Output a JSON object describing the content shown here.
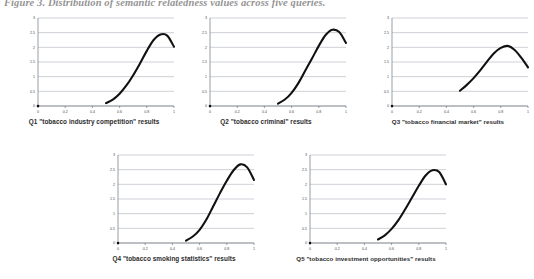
{
  "figure": {
    "title": "Figure 3. Distribution of semantic relatedness values across five queries.",
    "layout": "3 charts in top row, 2 charts in bottom row"
  },
  "charts": [
    {
      "id": "q1",
      "caption": "Q1 \"tobacco industry competition\" results",
      "chart_data": {
        "type": "line",
        "title": "Q1 \"tobacco industry competition\" results",
        "xlabel": "",
        "ylabel": "",
        "xlim": [
          0,
          1
        ],
        "ylim": [
          0,
          3
        ],
        "xticks": [
          "0",
          "0.2",
          "0.4",
          "0.6",
          "0.8",
          "1"
        ],
        "yticks": [
          "0",
          "0.5",
          "1",
          "1.5",
          "2",
          "2.5",
          "3"
        ],
        "grid": true,
        "legend": "none",
        "x": [
          0.0,
          0.5,
          0.55,
          0.6,
          0.65,
          0.7,
          0.75,
          0.8,
          0.85,
          0.9,
          0.95,
          1.0
        ],
        "y": [
          0.0,
          0.1,
          0.22,
          0.42,
          0.7,
          1.05,
          1.45,
          1.88,
          2.25,
          2.44,
          2.4,
          2.02
        ]
      }
    },
    {
      "id": "q2",
      "caption": "Q2 \"tobacco criminal\" results",
      "chart_data": {
        "type": "line",
        "title": "Q2 \"tobacco criminal\" results",
        "xlabel": "",
        "ylabel": "",
        "xlim": [
          0,
          1
        ],
        "ylim": [
          0,
          3
        ],
        "xticks": [
          "0",
          "0.2",
          "0.4",
          "0.6",
          "0.8",
          "1"
        ],
        "yticks": [
          "0",
          "0.5",
          "1",
          "1.5",
          "2",
          "2.5",
          "3"
        ],
        "grid": true,
        "legend": "none",
        "x": [
          0.0,
          0.5,
          0.55,
          0.6,
          0.65,
          0.7,
          0.75,
          0.8,
          0.85,
          0.9,
          0.95,
          1.0
        ],
        "y": [
          0.0,
          0.08,
          0.22,
          0.45,
          0.78,
          1.2,
          1.62,
          2.05,
          2.42,
          2.6,
          2.52,
          2.15
        ]
      }
    },
    {
      "id": "q3",
      "caption": "Q3 \"tobacco financial market\" results",
      "chart_data": {
        "type": "line",
        "title": "Q3 \"tobacco financial market\" results",
        "xlabel": "",
        "ylabel": "",
        "xlim": [
          0,
          1
        ],
        "ylim": [
          0,
          3
        ],
        "xticks": [
          "0",
          "0.2",
          "0.4",
          "0.6",
          "0.8",
          "1"
        ],
        "yticks": [
          "0",
          "0.5",
          "1",
          "1.5",
          "2",
          "2.5",
          "3"
        ],
        "grid": true,
        "legend": "none",
        "x": [
          0.0,
          0.5,
          0.55,
          0.6,
          0.65,
          0.7,
          0.75,
          0.8,
          0.85,
          0.9,
          0.95,
          1.0
        ],
        "y": [
          0.0,
          0.52,
          0.72,
          0.95,
          1.22,
          1.52,
          1.8,
          1.98,
          2.05,
          1.92,
          1.65,
          1.32
        ]
      }
    },
    {
      "id": "q4",
      "caption": "Q4 \"tobacco smoking statistics\" results",
      "chart_data": {
        "type": "line",
        "title": "Q4 \"tobacco smoking statistics\" results",
        "xlabel": "",
        "ylabel": "",
        "xlim": [
          0,
          1
        ],
        "ylim": [
          0,
          3
        ],
        "xticks": [
          "0",
          "0.2",
          "0.4",
          "0.6",
          "0.8",
          "1"
        ],
        "yticks": [
          "0",
          "0.5",
          "1",
          "1.5",
          "2",
          "2.5",
          "3"
        ],
        "grid": true,
        "legend": "none",
        "x": [
          0.0,
          0.5,
          0.55,
          0.6,
          0.65,
          0.7,
          0.75,
          0.8,
          0.85,
          0.9,
          0.95,
          1.0
        ],
        "y": [
          0.0,
          0.08,
          0.22,
          0.45,
          0.8,
          1.25,
          1.7,
          2.12,
          2.48,
          2.68,
          2.58,
          2.15
        ]
      }
    },
    {
      "id": "q5",
      "caption": "Q5 \"tobacco investment opportunities\" results",
      "chart_data": {
        "type": "line",
        "title": "Q5 \"tobacco investment opportunities\" results",
        "xlabel": "",
        "ylabel": "",
        "xlim": [
          0,
          1
        ],
        "ylim": [
          0,
          3
        ],
        "xticks": [
          "0",
          "0.2",
          "0.4",
          "0.6",
          "0.8",
          "1"
        ],
        "yticks": [
          "0",
          "0.5",
          "1",
          "1.5",
          "2",
          "2.5",
          "3"
        ],
        "grid": true,
        "legend": "none",
        "x": [
          0.0,
          0.5,
          0.55,
          0.6,
          0.65,
          0.7,
          0.75,
          0.8,
          0.85,
          0.9,
          0.95,
          1.0
        ],
        "y": [
          0.0,
          0.12,
          0.26,
          0.48,
          0.78,
          1.15,
          1.55,
          1.95,
          2.3,
          2.48,
          2.42,
          2.0
        ]
      }
    }
  ],
  "colors": {
    "curve": "#111111",
    "grid": "#9aa3ad",
    "axis": "#6e757d",
    "caption_text": "#2b2b2b",
    "title_text": "#3a3a3a",
    "background": "#ffffff"
  }
}
